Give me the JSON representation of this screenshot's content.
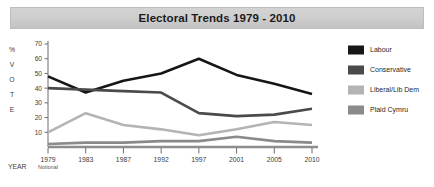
{
  "title": "Electoral Trends 1979 - 2010",
  "axes": {
    "y_label_chars": [
      "%",
      "V",
      "O",
      "T",
      "E"
    ],
    "y_label_full": "% VOTE",
    "x_label": "YEAR",
    "y_ticks": [
      0,
      10,
      20,
      30,
      40,
      50,
      60,
      70
    ],
    "x_tick_sub": "Notional"
  },
  "legend": {
    "position": "right",
    "items": [
      {
        "label": "Labour",
        "color": "#161616"
      },
      {
        "label": "Conservative",
        "color": "#4a4a4a"
      },
      {
        "label": "Liberal/Lib Dem",
        "color": "#b4b4b4"
      },
      {
        "label": "Plaid Cymru",
        "color": "#8a8a8a"
      }
    ]
  },
  "chart_data": {
    "type": "line",
    "title": "Electoral Trends 1979 - 2010",
    "xlabel": "YEAR",
    "ylabel": "% VOTE",
    "ylim": [
      0,
      70
    ],
    "yticks": [
      0,
      10,
      20,
      30,
      40,
      50,
      60,
      70
    ],
    "grid": false,
    "legend_position": "right",
    "categories": [
      "1979",
      "1983",
      "1987",
      "1992",
      "1997",
      "2001",
      "2005",
      "2010"
    ],
    "x_tick_annotations": {
      "1979": "Notional"
    },
    "series": [
      {
        "name": "Labour",
        "color": "#161616",
        "values": [
          48,
          37,
          45,
          50,
          60,
          49,
          43,
          36
        ]
      },
      {
        "name": "Conservative",
        "color": "#4a4a4a",
        "values": [
          40,
          39,
          38,
          37,
          23,
          21,
          22,
          26
        ]
      },
      {
        "name": "Liberal/Lib Dem",
        "color": "#b4b4b4",
        "values": [
          10,
          23,
          15,
          12,
          8,
          12,
          17,
          15
        ]
      },
      {
        "name": "Plaid Cymru",
        "color": "#8a8a8a",
        "values": [
          2,
          3,
          3,
          4,
          4,
          7,
          4,
          3
        ]
      }
    ]
  }
}
